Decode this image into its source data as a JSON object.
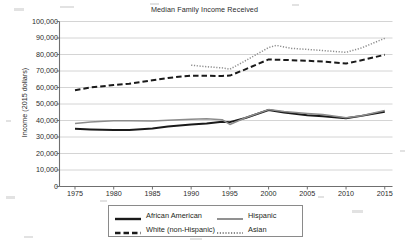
{
  "chart_data": {
    "type": "line",
    "title": "Median Family Income Received",
    "xlabel": "",
    "ylabel": "Income (2015 dollars)",
    "xlim": [
      1973,
      2016
    ],
    "ylim": [
      0,
      100000
    ],
    "xticks": [
      "1975",
      "1980",
      "1985",
      "1990",
      "1995",
      "2000",
      "2005",
      "2010",
      "2015"
    ],
    "xtick_values": [
      1975,
      1980,
      1985,
      1990,
      1995,
      2000,
      2005,
      2010,
      2015
    ],
    "yticks": [
      "0",
      "10,000",
      "20,000",
      "30,000",
      "40,000",
      "50,000",
      "60,000",
      "70,000",
      "80,000",
      "90,000",
      "100,000"
    ],
    "ytick_values": [
      0,
      10000,
      20000,
      30000,
      40000,
      50000,
      60000,
      70000,
      80000,
      90000,
      100000
    ],
    "grid": "horizontal",
    "legend_position": "bottom",
    "series": [
      {
        "name": "African American",
        "style": "solid-thick",
        "color": "#1a1a1a",
        "x": [
          1975,
          1977,
          1980,
          1982,
          1985,
          1987,
          1990,
          1992,
          1994,
          1995,
          1997,
          2000,
          2002,
          2005,
          2007,
          2010,
          2012,
          2015
        ],
        "values": [
          35000,
          34600,
          34300,
          34200,
          35100,
          36300,
          37600,
          38200,
          39300,
          39000,
          41500,
          46400,
          44800,
          43200,
          42600,
          41400,
          42800,
          45300
        ]
      },
      {
        "name": "White (non-Hispanic)",
        "style": "dashed",
        "color": "#1a1a1a",
        "x": [
          1975,
          1977,
          1980,
          1982,
          1985,
          1987,
          1990,
          1992,
          1994,
          1995,
          1997,
          2000,
          2002,
          2005,
          2007,
          2010,
          2012,
          2015
        ],
        "values": [
          58400,
          60000,
          61500,
          62300,
          64400,
          65800,
          67200,
          67100,
          67000,
          67200,
          71000,
          77000,
          76700,
          76200,
          75700,
          74500,
          76500,
          79800
        ]
      },
      {
        "name": "Hispanic",
        "style": "solid-thin",
        "color": "#8c8c8c",
        "x": [
          1975,
          1977,
          1980,
          1982,
          1985,
          1987,
          1990,
          1992,
          1994,
          1995,
          1997,
          2000,
          2002,
          2005,
          2007,
          2010,
          2012,
          2015
        ],
        "values": [
          38200,
          39100,
          39900,
          39800,
          39700,
          40200,
          40800,
          41000,
          40500,
          37600,
          41700,
          46600,
          45400,
          44300,
          43600,
          41600,
          42900,
          46100
        ]
      },
      {
        "name": "Asian",
        "style": "dotted",
        "color": "#8c8c8c",
        "x": [
          1990,
          1992,
          1994,
          1995,
          1997,
          2000,
          2001,
          2003,
          2005,
          2007,
          2010,
          2012,
          2015
        ],
        "values": [
          73500,
          72600,
          71900,
          71100,
          76200,
          84200,
          85500,
          83700,
          83100,
          82400,
          81300,
          84000,
          89800
        ]
      }
    ]
  },
  "legend": {
    "items": [
      {
        "label": "African American",
        "style": "solid-thick",
        "color": "#1a1a1a"
      },
      {
        "label": "White (non-Hispanic)",
        "style": "dashed",
        "color": "#1a1a1a"
      },
      {
        "label": "Hispanic",
        "style": "solid-thin",
        "color": "#8c8c8c"
      },
      {
        "label": "Asian",
        "style": "dotted",
        "color": "#8c8c8c"
      }
    ]
  },
  "axes": {
    "axis_color": "#6f6f6f",
    "grid_color": "#c9c9c9"
  }
}
